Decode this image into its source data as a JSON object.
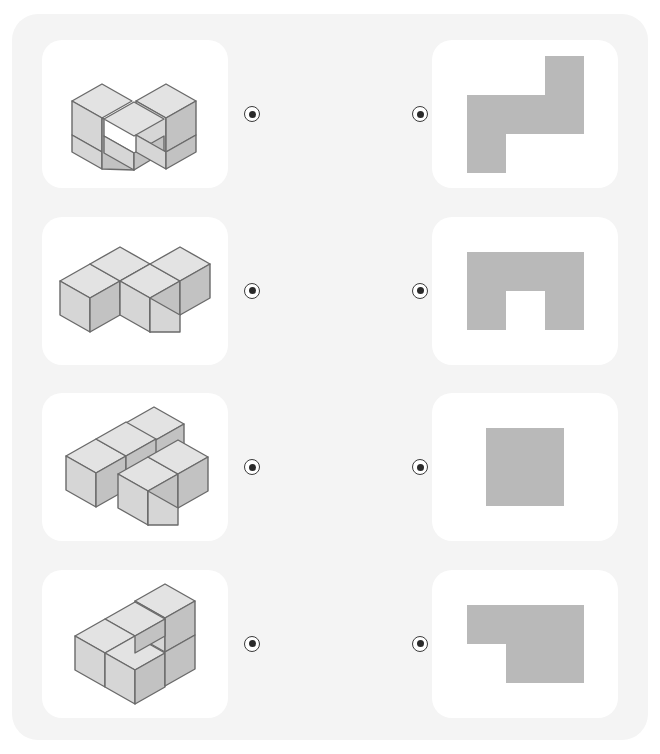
{
  "page": {
    "background_color": "#ffffff",
    "panel_color": "#f4f4f4",
    "card_color": "#ffffff"
  },
  "palette": {
    "silhouette_fill": "#b9b9b9",
    "cube_top": "#e3e3e3",
    "cube_left": "#d6d6d6",
    "cube_right": "#c2c2c2",
    "cube_stroke": "#6a6a6a",
    "connector_ring": "#3a3a3a",
    "connector_dot": "#2a2a2a"
  },
  "connector": {
    "icon": "radio-dot-icon",
    "label": ""
  },
  "rows": [
    {
      "id": "row-1",
      "left": {
        "name": "isometric-cube-figure-1",
        "cube_count": 5,
        "description": "Five cubes: L-shaped base of three with two stacked on the right",
        "cubes": [
          {
            "x": 0,
            "y": 0,
            "z": 0
          },
          {
            "x": 1,
            "y": 0,
            "z": 0
          },
          {
            "x": 1,
            "y": 1,
            "z": 0
          },
          {
            "x": 0,
            "y": 1,
            "z": 1
          },
          {
            "x": 1,
            "y": 1,
            "z": 1
          }
        ]
      },
      "right": {
        "name": "top-view-silhouette-1",
        "shape": "s-zigzag",
        "grid": [
          [
            0,
            0,
            1
          ],
          [
            1,
            1,
            1
          ],
          [
            1,
            0,
            0
          ]
        ],
        "cells_filled": 5
      }
    },
    {
      "id": "row-2",
      "left": {
        "name": "isometric-cube-figure-2",
        "cube_count": 4,
        "description": "Four cubes in a flat S/Z zigzag, all on one level",
        "cubes": [
          {
            "x": 0,
            "y": 0,
            "z": 0
          },
          {
            "x": 1,
            "y": 0,
            "z": 0
          },
          {
            "x": 1,
            "y": 1,
            "z": 0
          },
          {
            "x": 2,
            "y": 1,
            "z": 0
          }
        ]
      },
      "right": {
        "name": "top-view-silhouette-2",
        "shape": "u-arch",
        "grid": [
          [
            1,
            1,
            1
          ],
          [
            1,
            0,
            1
          ]
        ],
        "cells_filled": 5
      }
    },
    {
      "id": "row-3",
      "left": {
        "name": "isometric-cube-figure-3",
        "cube_count": 4,
        "description": "Four cubes: two stacked at back-centre with one left and one front-right",
        "cubes": [
          {
            "x": 0,
            "y": 1,
            "z": 0
          },
          {
            "x": 1,
            "y": 1,
            "z": 0
          },
          {
            "x": 1,
            "y": 0,
            "z": 0
          },
          {
            "x": 2,
            "y": 0,
            "z": 0
          }
        ]
      },
      "right": {
        "name": "top-view-silhouette-3",
        "shape": "square",
        "grid": [
          [
            1,
            1
          ],
          [
            1,
            1
          ]
        ],
        "cells_filled": 4
      }
    },
    {
      "id": "row-4",
      "left": {
        "name": "isometric-cube-figure-4",
        "cube_count": 4,
        "description": "Four cubes: 2x2 block on the floor with one cube stacked on the back-right",
        "cubes": [
          {
            "x": 0,
            "y": 0,
            "z": 0
          },
          {
            "x": 1,
            "y": 0,
            "z": 0
          },
          {
            "x": 0,
            "y": 1,
            "z": 0
          },
          {
            "x": 1,
            "y": 1,
            "z": 1
          }
        ]
      },
      "right": {
        "name": "top-view-silhouette-4",
        "shape": "p-block",
        "grid": [
          [
            1,
            1,
            1
          ],
          [
            0,
            1,
            1
          ]
        ],
        "cells_filled": 5
      }
    }
  ]
}
